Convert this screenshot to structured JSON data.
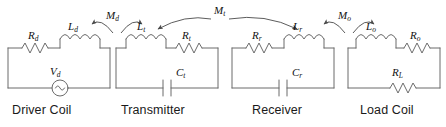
{
  "figure": {
    "stroke_color": "#6b6b6b",
    "label_color": "#111111",
    "caption_color": "#1a1a1a",
    "background": "#ffffff"
  },
  "stages": [
    {
      "caption": "Driver Coil",
      "resistor": {
        "symbol": "R",
        "sub": "d"
      },
      "inductor": {
        "symbol": "L",
        "sub": "d"
      },
      "bottom": {
        "type": "ac-source",
        "symbol": "V",
        "sub": "d"
      }
    },
    {
      "caption": "Transmitter",
      "resistor": {
        "symbol": "R",
        "sub": "t"
      },
      "inductor": {
        "symbol": "L",
        "sub": "t"
      },
      "bottom": {
        "type": "capacitor",
        "symbol": "C",
        "sub": "t"
      }
    },
    {
      "caption": "Receiver",
      "resistor": {
        "symbol": "R",
        "sub": "r"
      },
      "inductor": {
        "symbol": "L",
        "sub": "r"
      },
      "bottom": {
        "type": "capacitor",
        "symbol": "C",
        "sub": "r"
      }
    },
    {
      "caption": "Load Coil",
      "resistor": {
        "symbol": "R",
        "sub": "o"
      },
      "inductor": {
        "symbol": "L",
        "sub": "o"
      },
      "bottom": {
        "type": "resistor",
        "symbol": "R",
        "sub": "L"
      }
    }
  ],
  "couplings": [
    {
      "id": "driver-transmitter",
      "symbol": "M",
      "sub": "d"
    },
    {
      "id": "transmitter-receiver",
      "symbol": "M",
      "sub": "t"
    },
    {
      "id": "receiver-load",
      "symbol": "M",
      "sub": "o"
    }
  ]
}
